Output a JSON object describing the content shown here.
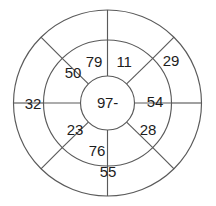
{
  "diagram": {
    "kind": "concentric-wheel-number-puzzle",
    "background_color": "#ffffff",
    "stroke_color": "#5a5a5a",
    "text_color": "#1d1d1d",
    "center": {
      "cx": 107.5,
      "cy": 103
    },
    "radii": {
      "hub": 27,
      "inner_ring_outer": 64,
      "outer_ring_outer": 94
    },
    "hub": {
      "name": "center-hub",
      "label": "97-"
    },
    "inner_ring": {
      "name": "inner-ring",
      "sector_count": 8,
      "cells": [
        {
          "id": "inner-1",
          "label": "11",
          "angle_deg": -67,
          "label_x": 124,
          "label_y": 63
        },
        {
          "id": "inner-2",
          "label": "54",
          "angle_deg": -22,
          "label_y": 103,
          "label_x": 155
        },
        {
          "id": "inner-3",
          "label": "28",
          "angle_deg": 22,
          "label_x": 148,
          "label_y": 131
        },
        {
          "id": "inner-4",
          "label": "",
          "angle_deg": 67,
          "label_x": 124,
          "label_y": 155
        },
        {
          "id": "inner-5",
          "label": "76",
          "angle_deg": 112,
          "label_x": 97,
          "label_y": 152
        },
        {
          "id": "inner-6",
          "label": "23",
          "angle_deg": 157,
          "label_x": 75,
          "label_y": 131
        },
        {
          "id": "inner-7",
          "label": "50",
          "angle_deg": 202,
          "label_x": 73,
          "label_y": 74
        },
        {
          "id": "inner-8",
          "label": "79",
          "angle_deg": 247,
          "label_x": 94,
          "label_y": 63
        }
      ]
    },
    "outer_ring": {
      "name": "outer-ring",
      "sector_count": 8,
      "cells": [
        {
          "id": "outer-1",
          "label": "29",
          "label_x": 171,
          "label_y": 62
        },
        {
          "id": "outer-2",
          "label": "",
          "label_x": 185,
          "label_y": 120
        },
        {
          "id": "outer-3",
          "label": "",
          "label_x": 152,
          "label_y": 167
        },
        {
          "id": "outer-4",
          "label": "55",
          "label_x": 108,
          "label_y": 173
        },
        {
          "id": "outer-5",
          "label": "",
          "label_x": 57,
          "label_y": 165
        },
        {
          "id": "outer-6",
          "label": "32",
          "label_x": 33,
          "label_y": 105
        },
        {
          "id": "outer-7",
          "label": "",
          "label_x": 40,
          "label_y": 60
        },
        {
          "id": "outer-8",
          "label": "",
          "label_x": 80,
          "label_y": 28
        }
      ]
    },
    "geometry": {
      "inner_spoke_angles_deg": [
        -90,
        -45,
        0,
        45,
        90,
        135,
        180,
        225
      ],
      "outer_spoke_angles_deg": [
        -90,
        -45,
        0,
        45,
        90,
        135,
        180,
        225
      ]
    }
  }
}
